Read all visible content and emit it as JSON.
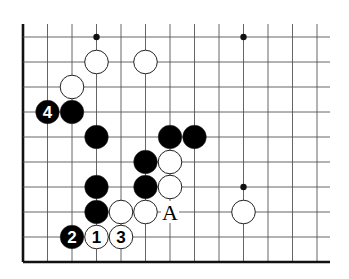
{
  "diagram": {
    "type": "go-board-fragment",
    "grid": {
      "columns": 13,
      "rows": 10,
      "origin_x": 23,
      "origin_y": 37,
      "spacing_x": 24.5,
      "spacing_y": 25,
      "top_extension_y": 24,
      "right_extension_x": 330,
      "left_edge_thick": true,
      "bottom_edge_thick": true,
      "line_color": "#555555",
      "edge_color": "#111111"
    },
    "hoshi": [
      {
        "col": 3,
        "row": 0
      },
      {
        "col": 9,
        "row": 0
      },
      {
        "col": 9,
        "row": 6
      }
    ],
    "stones": [
      {
        "color": "white",
        "col": 3,
        "row": 1,
        "label": ""
      },
      {
        "color": "white",
        "col": 5,
        "row": 1,
        "label": ""
      },
      {
        "color": "white",
        "col": 2,
        "row": 2,
        "label": ""
      },
      {
        "color": "black",
        "col": 1,
        "row": 3,
        "label": "4"
      },
      {
        "color": "black",
        "col": 2,
        "row": 3,
        "label": ""
      },
      {
        "color": "black",
        "col": 3,
        "row": 4,
        "label": ""
      },
      {
        "color": "black",
        "col": 6,
        "row": 4,
        "label": ""
      },
      {
        "color": "black",
        "col": 7,
        "row": 4,
        "label": ""
      },
      {
        "color": "black",
        "col": 5,
        "row": 5,
        "label": ""
      },
      {
        "color": "white",
        "col": 6,
        "row": 5,
        "label": ""
      },
      {
        "color": "black",
        "col": 3,
        "row": 6,
        "label": ""
      },
      {
        "color": "black",
        "col": 5,
        "row": 6,
        "label": ""
      },
      {
        "color": "white",
        "col": 6,
        "row": 6,
        "label": ""
      },
      {
        "color": "black",
        "col": 3,
        "row": 7,
        "label": ""
      },
      {
        "color": "white",
        "col": 4,
        "row": 7,
        "label": ""
      },
      {
        "color": "white",
        "col": 5,
        "row": 7,
        "label": ""
      },
      {
        "color": "white",
        "col": 9,
        "row": 7,
        "label": ""
      },
      {
        "color": "black",
        "col": 2,
        "row": 8,
        "label": "2"
      },
      {
        "color": "white",
        "col": 3,
        "row": 8,
        "label": "1"
      },
      {
        "color": "white",
        "col": 4,
        "row": 8,
        "label": "3"
      }
    ],
    "point_labels": [
      {
        "text": "A",
        "col": 6,
        "row": 7
      }
    ],
    "colors": {
      "black_stone": "#000000",
      "white_stone": "#ffffff",
      "stone_outline": "#222222",
      "background": "#ffffff"
    }
  }
}
